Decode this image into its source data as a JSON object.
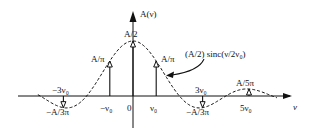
{
  "diagram": {
    "y_axis_label": "A(ν)",
    "x_axis_label": "ν",
    "origin_label": "0",
    "curve_label": "(A/2) sinc(ν/2ν₀)",
    "envelope": {
      "amplitude": 0.5,
      "function": "sinc",
      "argument": "ν/2ν₀"
    },
    "impulses": [
      {
        "position": -3,
        "position_label": "−3ν₀",
        "value_label": "−A/3π",
        "value": -0.1061
      },
      {
        "position": -1,
        "position_label": "−ν₀",
        "value_label": "A/π",
        "value": 0.3183
      },
      {
        "position": 0,
        "position_label": "",
        "value_label": "A/2",
        "value": 0.5
      },
      {
        "position": 1,
        "position_label": "ν₀",
        "value_label": "A/π",
        "value": 0.3183
      },
      {
        "position": 3,
        "position_label": "3ν₀",
        "value_label": "−A/3π",
        "value": -0.1061
      },
      {
        "position": 5,
        "position_label": "5ν₀",
        "value_label": "A/5π",
        "value": 0.0637
      }
    ],
    "colors": {
      "ink": "#111111",
      "background": "#ffffff"
    }
  }
}
